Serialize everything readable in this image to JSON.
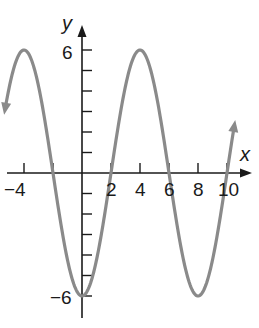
{
  "chart_data": {
    "type": "line",
    "title": "",
    "xlabel": "x",
    "ylabel": "y",
    "function": "y = -6 cos(pi x / 4)",
    "xlim": [
      -5.5,
      10.7
    ],
    "ylim": [
      -6.8,
      7
    ],
    "x_ticks": [
      -4,
      -2,
      0,
      2,
      4,
      6,
      8,
      10
    ],
    "x_tick_labels": [
      "-4",
      "2",
      "4",
      "6",
      "8",
      "10"
    ],
    "y_ticks": [
      -6,
      -5,
      -4,
      -3,
      -2,
      -1,
      0,
      1,
      2,
      3,
      4,
      5,
      6
    ],
    "y_tick_labels": [
      "6",
      "-6"
    ],
    "series": [
      {
        "name": "curve",
        "color": "#8a8a8a",
        "x": [
          -5.3,
          -4,
          -3,
          -2,
          -1,
          0,
          1,
          2,
          3,
          4,
          5,
          6,
          7,
          8,
          9,
          10,
          10.5
        ],
        "values": [
          3.65,
          6,
          4.24,
          0,
          -4.24,
          -6,
          -4.24,
          0,
          4.24,
          6,
          4.24,
          0,
          -4.24,
          -6,
          -4.24,
          0,
          2.3
        ]
      }
    ],
    "grid": false,
    "legend": false
  },
  "labels": {
    "x_axis": "x",
    "y_axis": "y",
    "x_neg4": "−4",
    "x_2": "2",
    "x_4": "4",
    "x_6": "6",
    "x_8": "8",
    "x_10": "10",
    "y_6": "6",
    "y_neg6": "−6"
  },
  "colors": {
    "curve": "#8a8a8a",
    "axis": "#1a1a1a"
  }
}
